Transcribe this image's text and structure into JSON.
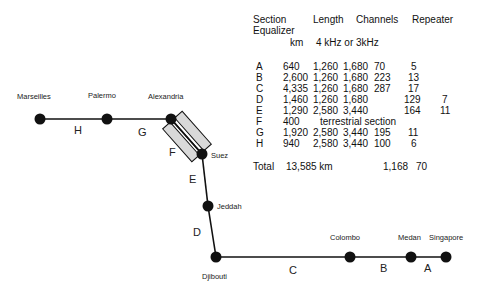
{
  "cities": [
    {
      "name": "Marseilles",
      "x": 40,
      "y": 119
    },
    {
      "name": "Palermo",
      "x": 107,
      "y": 119
    },
    {
      "name": "Alexandria",
      "x": 171,
      "y": 119
    },
    {
      "name": "Suez",
      "x": 202,
      "y": 154
    },
    {
      "name": "Jeddah",
      "x": 208,
      "y": 206
    },
    {
      "name": "Djibouti",
      "x": 216,
      "y": 257
    },
    {
      "name": "Colombo",
      "x": 350,
      "y": 257
    },
    {
      "name": "Medan",
      "x": 411,
      "y": 257
    },
    {
      "name": "Singapore",
      "x": 446,
      "y": 257
    }
  ],
  "segments": {
    "H": "H",
    "G": "G",
    "F": "F",
    "E": "E",
    "D": "D",
    "C": "C",
    "B": "B",
    "A": "A"
  },
  "table": {
    "header": {
      "section": "Section",
      "length": "Length",
      "channels": "Channels",
      "repeater": "Repeater",
      "equalizer": "Equalizer",
      "km": "km",
      "channel_units": "4 kHz or  3kHz"
    },
    "rows": [
      {
        "section": "A",
        "length": "640",
        "ch4": "1,260",
        "ch3": "1,680",
        "repeater": "70",
        "equalizer": "5",
        "extra": ""
      },
      {
        "section": "B",
        "length": "2,600",
        "ch4": "1,260",
        "ch3": "1,680",
        "repeater": "223",
        "equalizer": "13",
        "extra": ""
      },
      {
        "section": "C",
        "length": "4,335",
        "ch4": "1,260",
        "ch3": "1,680",
        "repeater": "287",
        "equalizer": "17",
        "extra": ""
      },
      {
        "section": "D",
        "length": "1,460",
        "ch4": "1,260",
        "ch3": "1,680",
        "repeater": "",
        "equalizer": "129",
        "extra": "7"
      },
      {
        "section": "E",
        "length": "1,290",
        "ch4": "2,580",
        "ch3": "3,440",
        "repeater": "",
        "equalizer": "164",
        "extra": "11"
      },
      {
        "section": "F",
        "length": "400",
        "note": "terrestrial section"
      },
      {
        "section": "G",
        "length": "1,920",
        "ch4": "2,580",
        "ch3": "3,440",
        "repeater": "195",
        "equalizer": "11",
        "extra": ""
      },
      {
        "section": "H",
        "length": "940",
        "ch4": "2,580",
        "ch3": "3,440",
        "repeater": "100",
        "equalizer": "6",
        "extra": ""
      }
    ],
    "total": {
      "label": "Total",
      "length": "13,585 km",
      "repeaters": "1,168",
      "equalizers": "70"
    }
  }
}
